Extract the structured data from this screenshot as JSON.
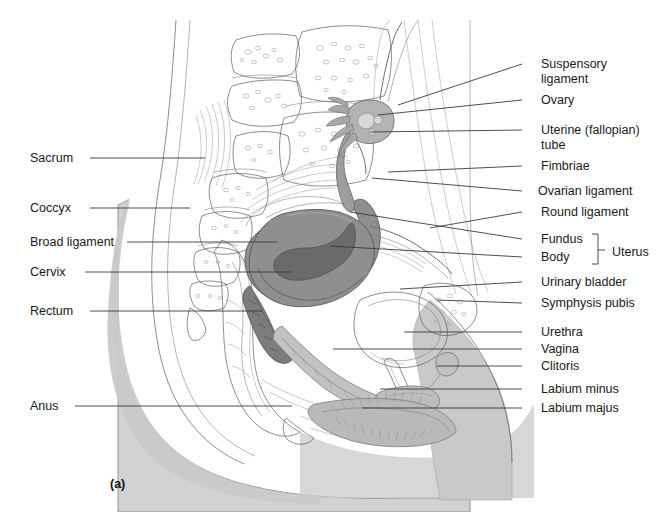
{
  "figure": {
    "caption": "(a)",
    "background_color": "#ffffff",
    "line_color": "#3a3a3a",
    "text_color": "#1a1a1a"
  },
  "colors": {
    "skin_shade": "#cfcfcf",
    "bone_shade": "#d4d4d4",
    "uterus_shade": "#8f8f8f",
    "uterus_dark": "#6e6e6e",
    "organ_light": "#ffffff",
    "outline": "#5d5d5d",
    "leader_line": "#3a3a3a"
  },
  "labels_left": [
    {
      "id": "sacrum",
      "text": "Sacrum",
      "text_x": 30,
      "text_y": 162,
      "line_x1": 90,
      "line_y1": 158,
      "line_x2": 205,
      "line_y2": 158
    },
    {
      "id": "coccyx",
      "text": "Coccyx",
      "text_x": 30,
      "text_y": 212,
      "line_x1": 90,
      "line_y1": 208,
      "line_x2": 190,
      "line_y2": 208
    },
    {
      "id": "broad-ligament",
      "text": "Broad ligament",
      "text_x": 30,
      "text_y": 246,
      "line_x1": 127,
      "line_y1": 242,
      "line_x2": 277,
      "line_y2": 242
    },
    {
      "id": "cervix",
      "text": "Cervix",
      "text_x": 30,
      "text_y": 276,
      "line_x1": 85,
      "line_y1": 272,
      "line_x2": 291,
      "line_y2": 272
    },
    {
      "id": "rectum",
      "text": "Rectum",
      "text_x": 30,
      "text_y": 315,
      "line_x1": 90,
      "line_y1": 311,
      "line_x2": 262,
      "line_y2": 311
    },
    {
      "id": "anus",
      "text": "Anus",
      "text_x": 30,
      "text_y": 410,
      "line_x1": 75,
      "line_y1": 406,
      "line_x2": 292,
      "line_y2": 406
    }
  ],
  "labels_right": [
    {
      "id": "suspensory-ligament",
      "text": "Suspensory",
      "text2": "ligament",
      "text_x": 541,
      "text_y": 68,
      "line_x1": 522,
      "line_y1": 64,
      "line_x2": 398,
      "line_y2": 105
    },
    {
      "id": "ovary",
      "text": "Ovary",
      "text2": "",
      "text_x": 541,
      "text_y": 104,
      "line_x1": 522,
      "line_y1": 100,
      "line_x2": 378,
      "line_y2": 115
    },
    {
      "id": "uterine-tube",
      "text": "Uterine (fallopian)",
      "text2": "tube",
      "text_x": 541,
      "text_y": 134,
      "line_x1": 522,
      "line_y1": 130,
      "line_x2": 370,
      "line_y2": 132
    },
    {
      "id": "fimbriae",
      "text": "Fimbriae",
      "text2": "",
      "text_x": 541,
      "text_y": 170,
      "line_x1": 522,
      "line_y1": 166,
      "line_x2": 388,
      "line_y2": 172
    },
    {
      "id": "ovarian-ligament",
      "text": "Ovarian ligament",
      "text2": "",
      "text_x": 538,
      "text_y": 195,
      "line_x1": 522,
      "line_y1": 191,
      "line_x2": 372,
      "line_y2": 178
    },
    {
      "id": "round-ligament",
      "text": "Round ligament",
      "text2": "",
      "text_x": 541,
      "text_y": 216,
      "line_x1": 522,
      "line_y1": 212,
      "line_x2": 430,
      "line_y2": 228
    },
    {
      "id": "fundus",
      "text": "Fundus",
      "text2": "",
      "text_x": 541,
      "text_y": 243,
      "line_x1": 522,
      "line_y1": 239,
      "line_x2": 350,
      "line_y2": 212
    },
    {
      "id": "body",
      "text": "Body",
      "text2": "",
      "text_x": 541,
      "text_y": 261,
      "line_x1": 522,
      "line_y1": 257,
      "line_x2": 330,
      "line_y2": 246
    },
    {
      "id": "urinary-bladder",
      "text": "Urinary bladder",
      "text2": "",
      "text_x": 541,
      "text_y": 286,
      "line_x1": 522,
      "line_y1": 282,
      "line_x2": 400,
      "line_y2": 289
    },
    {
      "id": "symphysis-pubis",
      "text": "Symphysis pubis",
      "text2": "",
      "text_x": 541,
      "text_y": 307,
      "line_x1": 522,
      "line_y1": 303,
      "line_x2": 437,
      "line_y2": 300
    },
    {
      "id": "urethra",
      "text": "Urethra",
      "text2": "",
      "text_x": 541,
      "text_y": 336,
      "line_x1": 522,
      "line_y1": 332,
      "line_x2": 404,
      "line_y2": 332
    },
    {
      "id": "vagina",
      "text": "Vagina",
      "text2": "",
      "text_x": 541,
      "text_y": 353,
      "line_x1": 522,
      "line_y1": 349,
      "line_x2": 333,
      "line_y2": 349
    },
    {
      "id": "clitoris",
      "text": "Clitoris",
      "text2": "",
      "text_x": 541,
      "text_y": 370,
      "line_x1": 522,
      "line_y1": 366,
      "line_x2": 437,
      "line_y2": 366
    },
    {
      "id": "labium-minus",
      "text": "Labium minus",
      "text2": "",
      "text_x": 541,
      "text_y": 393,
      "line_x1": 522,
      "line_y1": 389,
      "line_x2": 380,
      "line_y2": 389
    },
    {
      "id": "labium-majus",
      "text": "Labium majus",
      "text2": "",
      "text_x": 541,
      "text_y": 412,
      "line_x1": 522,
      "line_y1": 408,
      "line_x2": 362,
      "line_y2": 408
    }
  ],
  "bracket": {
    "label": "Uterus",
    "label_x": 612,
    "label_y": 256,
    "x": 598,
    "y_top": 234,
    "y_bottom": 264,
    "tip_y": 250
  }
}
